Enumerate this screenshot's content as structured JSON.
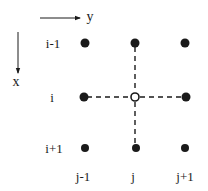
{
  "diagram": {
    "title": "",
    "type": "finite-difference-stencil",
    "axes": {
      "y_axis": {
        "label": "y",
        "direction": "right"
      },
      "x_axis": {
        "label": "x",
        "direction": "down"
      }
    },
    "row_labels": [
      "i-1",
      "i",
      "i+1"
    ],
    "col_labels": [
      "j-1",
      "j",
      "j+1"
    ],
    "nodes": [
      {
        "row": "i-1",
        "col": "j-1",
        "style": "filled"
      },
      {
        "row": "i-1",
        "col": "j",
        "style": "filled"
      },
      {
        "row": "i-1",
        "col": "j+1",
        "style": "filled"
      },
      {
        "row": "i",
        "col": "j-1",
        "style": "filled"
      },
      {
        "row": "i",
        "col": "j",
        "style": "hollow"
      },
      {
        "row": "i",
        "col": "j+1",
        "style": "filled"
      },
      {
        "row": "i+1",
        "col": "j-1",
        "style": "filled"
      },
      {
        "row": "i+1",
        "col": "j",
        "style": "filled"
      },
      {
        "row": "i+1",
        "col": "j+1",
        "style": "filled"
      }
    ],
    "connections": [
      {
        "from": "i,j",
        "to": "i-1,j",
        "style": "dashed"
      },
      {
        "from": "i,j",
        "to": "i+1,j",
        "style": "dashed"
      },
      {
        "from": "i,j",
        "to": "i,j-1",
        "style": "dashed"
      },
      {
        "from": "i,j",
        "to": "i,j+1",
        "style": "dashed"
      }
    ],
    "colors": {
      "ink": "#1a1a1a",
      "background": "#ffffff"
    }
  }
}
